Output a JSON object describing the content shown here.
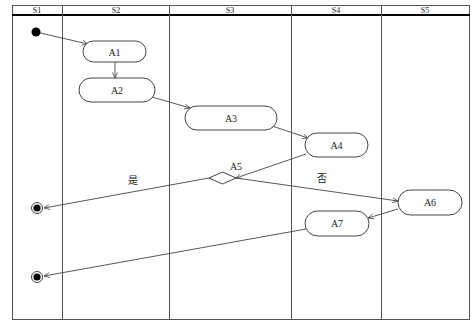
{
  "diagram": {
    "type": "UML activity diagram with swimlanes",
    "lanes": [
      {
        "id": "S1",
        "label": "S1"
      },
      {
        "id": "S2",
        "label": "S2"
      },
      {
        "id": "S3",
        "label": "S3"
      },
      {
        "id": "S4",
        "label": "S4"
      },
      {
        "id": "S5",
        "label": "S5"
      }
    ],
    "nodes": {
      "start": {
        "type": "initial",
        "lane": "S1"
      },
      "A1": {
        "label": "A1",
        "lane": "S2"
      },
      "A2": {
        "label": "A2",
        "lane": "S2"
      },
      "A3": {
        "label": "A3",
        "lane": "S3"
      },
      "A4": {
        "label": "A4",
        "lane": "S4"
      },
      "A5": {
        "label": "A5",
        "type": "decision",
        "lane": "S3"
      },
      "A6": {
        "label": "A6",
        "lane": "S5"
      },
      "A7": {
        "label": "A7",
        "lane": "S4"
      },
      "end1": {
        "type": "final",
        "lane": "S1"
      },
      "end2": {
        "type": "final",
        "lane": "S1"
      }
    },
    "edges": [
      {
        "from": "start",
        "to": "A1"
      },
      {
        "from": "A1",
        "to": "A2"
      },
      {
        "from": "A2",
        "to": "A3"
      },
      {
        "from": "A3",
        "to": "A4"
      },
      {
        "from": "A4",
        "to": "A5"
      },
      {
        "from": "A5",
        "to": "end1",
        "label": "是"
      },
      {
        "from": "A5",
        "to": "A6",
        "label": "否"
      },
      {
        "from": "A6",
        "to": "A7"
      },
      {
        "from": "A7",
        "to": "end2"
      }
    ],
    "edge_labels": {
      "yes": "是",
      "no": "否"
    },
    "colors": {
      "line": "#444444",
      "header_rule": "#000000",
      "fill": "#ffffff"
    }
  }
}
